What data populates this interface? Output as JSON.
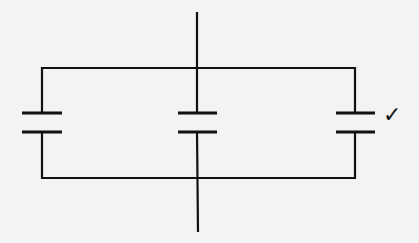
{
  "diagram": {
    "type": "circuit",
    "components": [
      {
        "id": "capacitor-left",
        "kind": "capacitor"
      },
      {
        "id": "capacitor-center",
        "kind": "capacitor"
      },
      {
        "id": "capacitor-right",
        "kind": "capacitor",
        "marked": true
      }
    ],
    "mark": "✓",
    "line_color": "#111111",
    "background": "#f3f3f3"
  }
}
